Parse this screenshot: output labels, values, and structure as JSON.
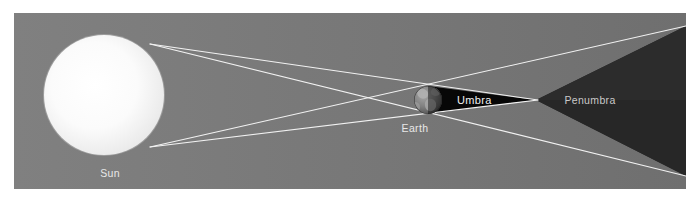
{
  "diagram": {
    "type": "solar-system-shadow-diagram",
    "title_visible": false,
    "background_color": "#ffffff",
    "canvas": {
      "width": 695,
      "height": 202,
      "scene_left": 14,
      "scene_top": 13,
      "scene_right": 686,
      "scene_bottom": 189
    },
    "colors": {
      "space_background": "#7b7b7b",
      "penumbra_fill": "#2a2a2a",
      "umbra_fill": "#080808",
      "ray_line": "#f2f2f2",
      "sun_core": "#ffffff",
      "sun_edge": "#ededed",
      "earth_ocean": "#6d6d6d",
      "earth_land": "#9a9a9a",
      "label_text": "#e8e8e8",
      "penumbra_label_text": "#c9c9c9"
    },
    "bodies": {
      "sun": {
        "label": "Sun",
        "center_x": 104,
        "center_y": 95,
        "radius": 60,
        "label_x": 110,
        "label_y": 176
      },
      "earth": {
        "label": "Earth",
        "center_x": 428,
        "center_y": 100,
        "radius": 14,
        "label_x": 414,
        "label_y": 131
      }
    },
    "shadow_regions": {
      "umbra": {
        "label": "Umbra",
        "apex_x": 536,
        "apex_y": 100,
        "base_x": 428,
        "base_top_y": 86,
        "base_bottom_y": 114,
        "label_x": 458,
        "label_y": 104
      },
      "penumbra": {
        "label": "Penumbra",
        "label_x": 590,
        "label_y": 104,
        "edge_top_right_y": 26,
        "edge_bottom_right_y": 176
      }
    },
    "rays": [
      {
        "name": "sun-top-to-earth-bottom-tangent",
        "x1": 152,
        "y1": 45,
        "x2": 686,
        "y2": 176
      },
      {
        "name": "sun-top-to-earth-top-tangent",
        "x1": 152,
        "y1": 45,
        "x2": 536,
        "y2": 100
      },
      {
        "name": "sun-bottom-to-earth-top-tangent",
        "x1": 152,
        "y1": 146,
        "x2": 686,
        "y2": 26
      },
      {
        "name": "sun-bottom-to-earth-bottom-tangent",
        "x1": 152,
        "y1": 146,
        "x2": 536,
        "y2": 100
      }
    ]
  },
  "labels": {
    "sun": "Sun",
    "earth": "Earth",
    "umbra": "Umbra",
    "penumbra": "Penumbra"
  }
}
